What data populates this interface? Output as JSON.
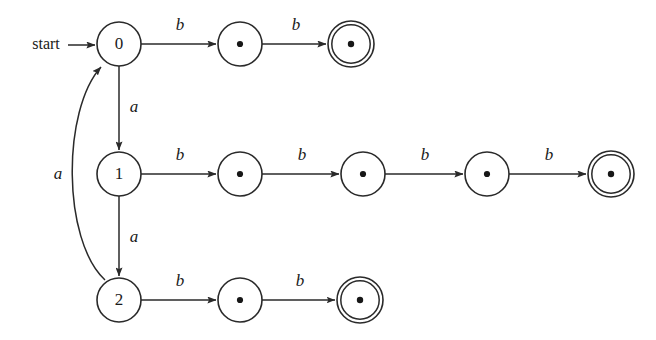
{
  "diagram": {
    "background_color": "#ffffff",
    "stroke_color": "#2a2a2a",
    "text_color": "#1a1a1a",
    "start_label": "start",
    "alphabet": [
      "a",
      "b"
    ],
    "named_states": [
      {
        "id": "q0",
        "label": "0",
        "cx": 119,
        "cy": 44,
        "r": 22,
        "accepting": false,
        "dot": false
      },
      {
        "id": "q1",
        "label": "1",
        "cx": 119,
        "cy": 174,
        "r": 22,
        "accepting": false,
        "dot": false
      },
      {
        "id": "q2",
        "label": "2",
        "cx": 119,
        "cy": 300,
        "r": 22,
        "accepting": false,
        "dot": false
      }
    ],
    "dot_states": [
      {
        "id": "t0a",
        "label": "•",
        "cx": 240,
        "cy": 44,
        "r": 22,
        "accepting": false,
        "dot": true
      },
      {
        "id": "t0b",
        "label": "•",
        "cx": 351,
        "cy": 44,
        "r": 23,
        "accepting": true,
        "dot": true
      },
      {
        "id": "t1a",
        "label": "•",
        "cx": 240,
        "cy": 174,
        "r": 22,
        "accepting": false,
        "dot": true
      },
      {
        "id": "t1b",
        "label": "•",
        "cx": 363,
        "cy": 174,
        "r": 22,
        "accepting": false,
        "dot": true
      },
      {
        "id": "t1c",
        "label": "•",
        "cx": 487,
        "cy": 174,
        "r": 22,
        "accepting": false,
        "dot": true
      },
      {
        "id": "t1d",
        "label": "•",
        "cx": 611,
        "cy": 174,
        "r": 23,
        "accepting": true,
        "dot": true
      },
      {
        "id": "t2a",
        "label": "•",
        "cx": 240,
        "cy": 300,
        "r": 22,
        "accepting": false,
        "dot": true
      },
      {
        "id": "t2b",
        "label": "•",
        "cx": 360,
        "cy": 300,
        "r": 23,
        "accepting": true,
        "dot": true
      }
    ],
    "transitions": [
      {
        "id": "e-q0-t0a",
        "from": "q0",
        "to": "t0a",
        "label": "b",
        "lx": 180,
        "ly": 26
      },
      {
        "id": "e-t0a-t0b",
        "from": "t0a",
        "to": "t0b",
        "label": "b",
        "lx": 296,
        "ly": 26
      },
      {
        "id": "e-q1-t1a",
        "from": "q1",
        "to": "t1a",
        "label": "b",
        "lx": 180,
        "ly": 156
      },
      {
        "id": "e-t1a-t1b",
        "from": "t1a",
        "to": "t1b",
        "label": "b",
        "lx": 302,
        "ly": 156
      },
      {
        "id": "e-t1b-t1c",
        "from": "t1b",
        "to": "t1c",
        "label": "b",
        "lx": 425,
        "ly": 156
      },
      {
        "id": "e-t1c-t1d",
        "from": "t1c",
        "to": "t1d",
        "label": "b",
        "lx": 549,
        "ly": 156
      },
      {
        "id": "e-q2-t2a",
        "from": "q2",
        "to": "t2a",
        "label": "b",
        "lx": 180,
        "ly": 282
      },
      {
        "id": "e-t2a-t2b",
        "from": "t2a",
        "to": "t2b",
        "label": "b",
        "lx": 300,
        "ly": 282
      },
      {
        "id": "e-q0-q1",
        "from": "q0",
        "to": "q1",
        "label": "a",
        "lx": 134,
        "ly": 108
      },
      {
        "id": "e-q1-q2",
        "from": "q1",
        "to": "q2",
        "label": "a",
        "lx": 134,
        "ly": 238
      },
      {
        "id": "e-q2-q0",
        "from": "q2",
        "to": "q0",
        "label": "a",
        "lx": 58,
        "ly": 175
      }
    ],
    "start_arrow": {
      "label": "start",
      "label_x": 46,
      "label_y": 45,
      "line_from_x": 68,
      "line_to_x": 95,
      "y": 45
    }
  }
}
